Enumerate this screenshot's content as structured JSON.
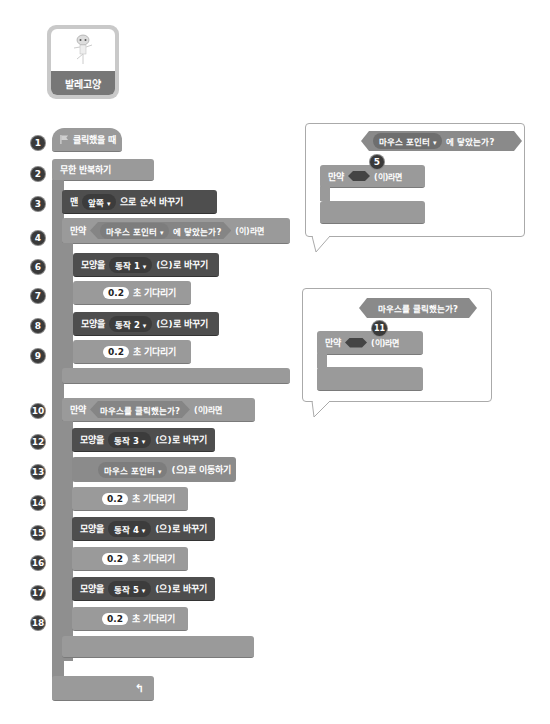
{
  "sprite": {
    "name": "발레고양"
  },
  "markers": [
    "1",
    "2",
    "3",
    "4",
    "6",
    "7",
    "8",
    "9",
    "10",
    "12",
    "13",
    "14",
    "15",
    "16",
    "17",
    "18"
  ],
  "script": {
    "hat": "클릭했을 때",
    "forever": "무한 반복하기",
    "go_to_front": {
      "prefix": "맨",
      "option": "앞쪽",
      "suffix": "으로 순서 바꾸기"
    },
    "if1": {
      "label": "만약",
      "condition_option": "마우스 포인터",
      "condition_suffix": "에 닿았는가?",
      "then": "(이)라면"
    },
    "switch1": {
      "label": "모양을",
      "option": "동작 1",
      "suffix": "(으)로 바꾸기"
    },
    "wait1": {
      "value": "0.2",
      "suffix": "초 기다리기"
    },
    "switch2": {
      "label": "모양을",
      "option": "동작 2",
      "suffix": "(으)로 바꾸기"
    },
    "wait2": {
      "value": "0.2",
      "suffix": "초 기다리기"
    },
    "if2": {
      "label": "만약",
      "condition": "마우스를 클릭했는가?",
      "then": "(이)라면"
    },
    "switch3": {
      "label": "모양을",
      "option": "동작 3",
      "suffix": "(으)로 바꾸기"
    },
    "goto": {
      "option": "마우스 포인터",
      "suffix": "(으)로 이동하기"
    },
    "wait3": {
      "value": "0.2",
      "suffix": "초 기다리기"
    },
    "switch4": {
      "label": "모양을",
      "option": "동작 4",
      "suffix": "(으)로 바꾸기"
    },
    "wait4": {
      "value": "0.2",
      "suffix": "초 기다리기"
    },
    "switch5": {
      "label": "모양을",
      "option": "동작 5",
      "suffix": "(으)로 바꾸기"
    },
    "wait5": {
      "value": "0.2",
      "suffix": "초 기다리기"
    }
  },
  "callout1": {
    "step": "5",
    "sensor_option": "마우스 포인터",
    "sensor_suffix": "에 닿았는가?",
    "if_label": "만약",
    "then": "(이)라면"
  },
  "callout2": {
    "step": "11",
    "sensor": "마우스를 클릭했는가?",
    "if_label": "만약",
    "then": "(이)라면"
  }
}
